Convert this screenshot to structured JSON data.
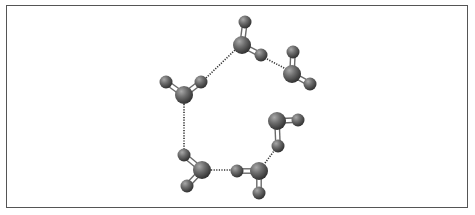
{
  "diagram": {
    "type": "molecular-cluster",
    "colors": {
      "atom_light": "#9a9a9a",
      "atom_mid": "#6e6e6e",
      "atom_dark": "#3a3a3a",
      "bond": "#6a6a6a",
      "contact": "#333333",
      "frame": "#555555"
    },
    "molecules": [
      {
        "id": "m1",
        "atoms": [
          {
            "x": 245,
            "y": 22,
            "r": 6.5
          },
          {
            "x": 242,
            "y": 45,
            "r": 9
          },
          {
            "x": 261,
            "y": 55,
            "r": 6.5
          }
        ],
        "bonds": [
          [
            1,
            0
          ],
          [
            1,
            2
          ]
        ]
      },
      {
        "id": "m2",
        "atoms": [
          {
            "x": 293,
            "y": 52,
            "r": 6.5
          },
          {
            "x": 292,
            "y": 74,
            "r": 9
          },
          {
            "x": 310,
            "y": 84,
            "r": 6.5
          }
        ],
        "bonds": [
          [
            1,
            0
          ],
          [
            1,
            2
          ]
        ]
      },
      {
        "id": "m3",
        "atoms": [
          {
            "x": 166,
            "y": 82,
            "r": 6.5
          },
          {
            "x": 184,
            "y": 95,
            "r": 9
          },
          {
            "x": 201,
            "y": 82,
            "r": 6.5
          }
        ],
        "bonds": [
          [
            1,
            0
          ],
          [
            1,
            2
          ]
        ]
      },
      {
        "id": "m4",
        "atoms": [
          {
            "x": 184,
            "y": 155,
            "r": 6.5
          },
          {
            "x": 202,
            "y": 170,
            "r": 9
          },
          {
            "x": 187,
            "y": 186,
            "r": 6.5
          }
        ],
        "bonds": [
          [
            1,
            0
          ],
          [
            1,
            2
          ]
        ]
      },
      {
        "id": "m5",
        "atoms": [
          {
            "x": 237,
            "y": 171,
            "r": 6.5
          },
          {
            "x": 259,
            "y": 171,
            "r": 9
          },
          {
            "x": 259,
            "y": 193,
            "r": 6.5
          }
        ],
        "bonds": [
          [
            1,
            0
          ],
          [
            1,
            2
          ]
        ]
      },
      {
        "id": "m6",
        "atoms": [
          {
            "x": 277,
            "y": 121,
            "r": 9
          },
          {
            "x": 298,
            "y": 120,
            "r": 6.5
          },
          {
            "x": 278,
            "y": 146,
            "r": 6.5
          }
        ],
        "bonds": [
          [
            0,
            1
          ],
          [
            0,
            2
          ]
        ]
      }
    ],
    "contacts": [
      {
        "x1": 206,
        "y1": 78,
        "x2": 235,
        "y2": 50
      },
      {
        "x1": 267,
        "y1": 59,
        "x2": 286,
        "y2": 69
      },
      {
        "x1": 184,
        "y1": 104,
        "x2": 184,
        "y2": 149
      },
      {
        "x1": 211,
        "y1": 170,
        "x2": 231,
        "y2": 170
      },
      {
        "x1": 265,
        "y1": 163,
        "x2": 274,
        "y2": 151
      }
    ]
  }
}
